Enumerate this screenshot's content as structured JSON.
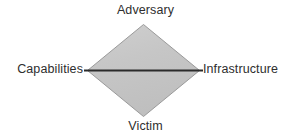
{
  "diagram": {
    "background_color": "#ffffff",
    "shape": {
      "name": "diamond",
      "fill_color": "#c6c6c6",
      "stroke_color": "#9a9a9a",
      "center_x": 143.5,
      "center_y": 70.5,
      "half_width": 56,
      "half_height": 46
    },
    "axis": {
      "name": "horizontal-axis",
      "color": "#2b2b2b",
      "thickness": 2,
      "x_start": 84,
      "x_end": 203,
      "y": 70.5
    },
    "label_color": "#2e2e2e",
    "nodes": [
      {
        "id": "adversary",
        "label": "Adversary",
        "position": "top"
      },
      {
        "id": "capabilities",
        "label": "Capabilities",
        "position": "left"
      },
      {
        "id": "infrastructure",
        "label": "Infrastructure",
        "position": "right"
      },
      {
        "id": "victim",
        "label": "Victim",
        "position": "bottom"
      }
    ]
  }
}
